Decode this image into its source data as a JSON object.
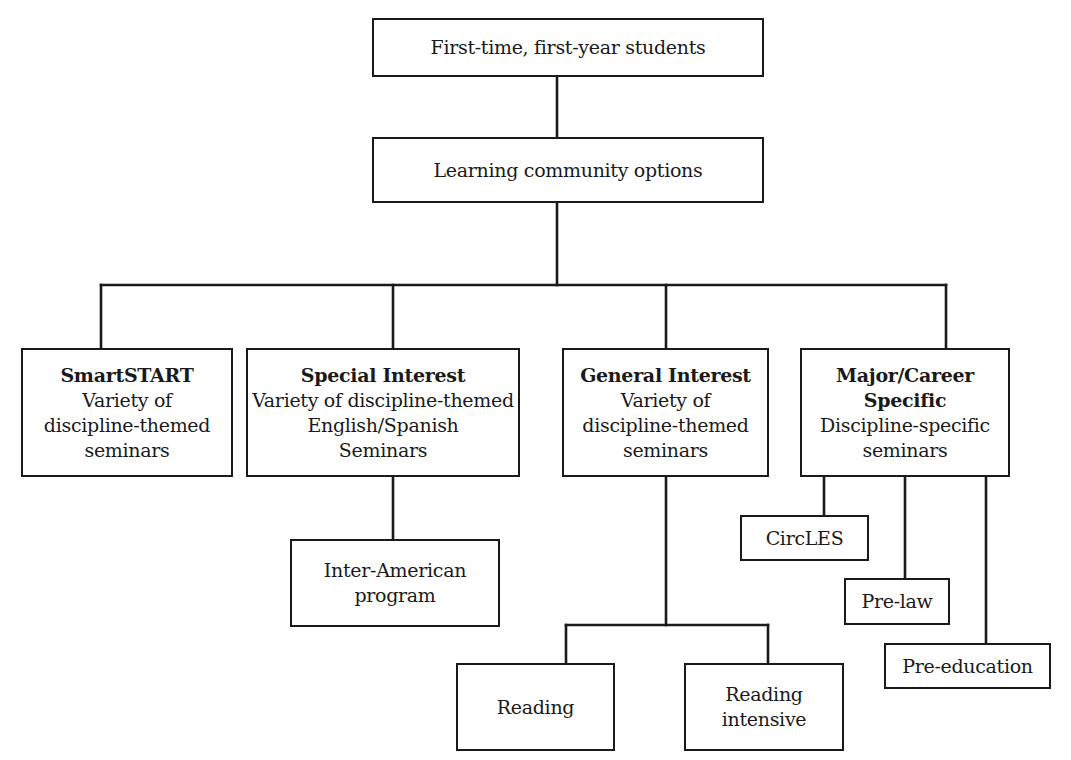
{
  "diagram": {
    "root": {
      "label": "First-time, first-year students"
    },
    "options": {
      "label": "Learning community options"
    },
    "categories": [
      {
        "id": "smartstart",
        "title": "SmartSTART",
        "lines": [
          "Variety of",
          "discipline-themed",
          "seminars"
        ]
      },
      {
        "id": "special-interest",
        "title": "Special Interest",
        "lines": [
          "Variety of discipline-themed",
          "English/Spanish",
          "Seminars"
        ]
      },
      {
        "id": "general-interest",
        "title": "General Interest",
        "lines": [
          "Variety of",
          "discipline-themed",
          "seminars"
        ]
      },
      {
        "id": "major-career",
        "title_lines": [
          "Major/Career",
          "Specific"
        ],
        "lines": [
          "Discipline-specific",
          "seminars"
        ]
      }
    ],
    "subprograms": {
      "inter_american": {
        "lines": [
          "Inter-American",
          "program"
        ],
        "parent": "special-interest"
      },
      "reading": {
        "lines": [
          "Reading"
        ],
        "parent": "general-interest"
      },
      "reading_intensive": {
        "lines": [
          "Reading",
          "intensive"
        ],
        "parent": "general-interest"
      },
      "circles": {
        "lines": [
          "CircLES"
        ],
        "parent": "major-career"
      },
      "pre_law": {
        "lines": [
          "Pre-law"
        ],
        "parent": "major-career"
      },
      "pre_education": {
        "lines": [
          "Pre-education"
        ],
        "parent": "major-career"
      }
    }
  }
}
